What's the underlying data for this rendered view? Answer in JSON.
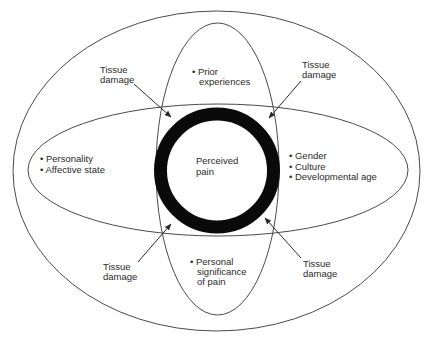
{
  "diagram": {
    "center": {
      "label_line1": "Perceived",
      "label_line2": "pain"
    },
    "left_factors": [
      "• Personality",
      "• Affective state"
    ],
    "right_factors": [
      "• Gender",
      "• Culture",
      "• Developmental age"
    ],
    "top_factors": [
      "• Prior",
      "experiences"
    ],
    "bottom_factors": [
      "• Personal",
      "significance",
      "of pain"
    ],
    "tissue_damage": {
      "top_left": [
        "Tissue",
        "damage"
      ],
      "top_right": [
        "Tissue",
        "damage"
      ],
      "bottom_left": [
        "Tissue",
        "damage"
      ],
      "bottom_right": [
        "Tissue",
        "damage"
      ]
    },
    "colors": {
      "ring": "#0a0a0a",
      "lines": "#4a4a4a",
      "text": "#2a2a2a",
      "background": "#ffffff"
    }
  }
}
